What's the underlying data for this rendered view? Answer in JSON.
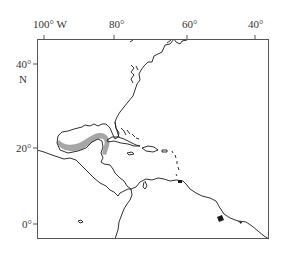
{
  "map": {
    "region": "Gulf of Mexico, Caribbean and western North Atlantic",
    "highlight_color": "#a6a6a6",
    "coast_color": "#1a1a1a",
    "frame_color": "#555555",
    "longitude_labels": [
      {
        "label": "100° W",
        "value": -100
      },
      {
        "label": "80°",
        "value": -80
      },
      {
        "label": "60°",
        "value": -60
      },
      {
        "label": "40°",
        "value": -40
      }
    ],
    "latitude_labels": [
      {
        "label": "40°",
        "value": 40
      },
      {
        "label": "N",
        "value": null
      },
      {
        "label": "20°",
        "value": 20
      },
      {
        "label": "0°",
        "value": 0
      }
    ],
    "highlighted_area": "Gulf of Mexico coastal band (western/southern Gulf, Texas–Mexico–Yucatán)"
  }
}
